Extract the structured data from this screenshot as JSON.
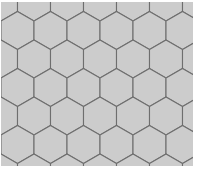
{
  "figure": {
    "title": "Hexagonal Tiling Pattern",
    "description": "Honeycomb tessellation of regular hexagons",
    "canvas": {
      "width": 200,
      "height": 172,
      "background_color": "#ffffff"
    },
    "pattern": {
      "shape": "hexagon",
      "orientation": "pointy-top",
      "tiling": "honeycomb",
      "fill_color": "#cccccc",
      "stroke_color": "#6e6e6e",
      "stroke_width": 1.1,
      "hex_width": 33,
      "hex_height": 38,
      "column_spacing": 33,
      "row_spacing": 28.5,
      "columns": 7,
      "rows": 7,
      "origin_x": 1,
      "origin_y": 2,
      "margin_left": 1,
      "margin_top": 2,
      "margin_right": 7,
      "margin_bottom": 6
    },
    "caption": ""
  }
}
